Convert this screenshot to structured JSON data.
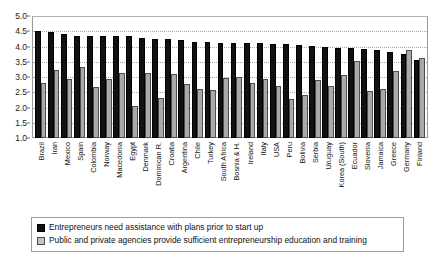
{
  "chart_data": {
    "type": "bar",
    "title": "",
    "subtitle": "",
    "xlabel": "",
    "ylabel": "",
    "ylim": [
      1.0,
      5.0
    ],
    "ytick_labels": [
      "1.0",
      "1.5",
      "2.0",
      "2.5",
      "3.0",
      "3.5",
      "4.0",
      "4.5",
      "5.0"
    ],
    "ytick_values": [
      1.0,
      1.5,
      2.0,
      2.5,
      3.0,
      3.5,
      4.0,
      4.5,
      5.0
    ],
    "grid": true,
    "legend_position": "bottom",
    "categories": [
      "Brazil",
      "Iran",
      "Mexico",
      "Spain",
      "Colombia",
      "Norway",
      "Macedonia",
      "Egypt",
      "Denmark",
      "Dominican R.",
      "Croatia",
      "Argentina",
      "Chile",
      "Turkey",
      "South Africa",
      "Bosnia & H.",
      "Ireland",
      "Italy",
      "USA",
      "Peru",
      "Bolivia",
      "Serbia",
      "Uruguay",
      "Korea (South)",
      "Ecuador",
      "Slovenia",
      "Jamaica",
      "Greece",
      "Germany",
      "Finland"
    ],
    "series": [
      {
        "name": "Entrepreneurs need assistance with plans prior to start up",
        "color": "#111111",
        "values": [
          4.52,
          4.47,
          4.42,
          4.36,
          4.36,
          4.35,
          4.35,
          4.34,
          4.29,
          4.25,
          4.25,
          4.21,
          4.15,
          4.15,
          4.13,
          4.12,
          4.11,
          4.1,
          4.09,
          4.07,
          4.05,
          4.02,
          3.98,
          3.96,
          3.94,
          3.92,
          3.88,
          3.82,
          3.74,
          3.55
        ]
      },
      {
        "name": "Public and private agencies provide sufficient entrepreneurship education and training",
        "color": "#a9a9a9",
        "values": [
          2.82,
          3.24,
          2.94,
          3.34,
          2.66,
          2.95,
          3.12,
          2.06,
          3.13,
          2.31,
          3.09,
          2.76,
          2.62,
          2.56,
          2.98,
          3.0,
          2.82,
          2.92,
          2.72,
          2.28,
          2.42,
          2.9,
          2.72,
          3.06,
          3.52,
          2.54,
          2.6,
          3.2,
          3.9,
          3.62
        ]
      }
    ]
  },
  "legend": {
    "items": [
      {
        "swatch": "dark",
        "label": "Entrepreneurs need assistance with plans prior to start up"
      },
      {
        "swatch": "light",
        "label": "Public and private agencies provide sufficient entrepreneurship education and training"
      }
    ]
  }
}
